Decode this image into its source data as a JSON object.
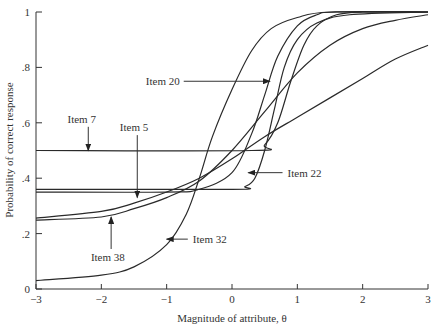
{
  "chart_data": {
    "type": "line",
    "title": "",
    "xlabel": "Magnitude of attribute, θ",
    "ylabel": "Probability of correct response",
    "xlim": [
      -3,
      3
    ],
    "ylim": [
      0,
      1
    ],
    "xticks": [
      -3,
      -2,
      -1,
      0,
      1,
      2,
      3
    ],
    "xtick_labels": [
      "−3",
      "−2",
      "−1",
      "0",
      "1",
      "2",
      "3"
    ],
    "yticks": [
      0,
      0.2,
      0.4,
      0.6,
      0.8,
      1
    ],
    "ytick_labels": [
      "0",
      ".2",
      ".4",
      ".6",
      ".8",
      "1"
    ],
    "grid": false,
    "legend": "none (inline annotations with arrows)",
    "series": [
      {
        "name": "Item 32",
        "x": [
          -3,
          -2,
          -1.5,
          -1,
          -0.7,
          -0.5,
          -0.3,
          0,
          0.3,
          0.6,
          1,
          1.5,
          3
        ],
        "values": [
          0.03,
          0.05,
          0.08,
          0.16,
          0.27,
          0.4,
          0.55,
          0.72,
          0.86,
          0.94,
          0.98,
          1,
          1
        ]
      },
      {
        "name": "Item 20",
        "x": [
          -3,
          -1,
          -0.5,
          0,
          0.3,
          0.5,
          0.7,
          1,
          1.3,
          1.6,
          3
        ],
        "values": [
          0.35,
          0.35,
          0.36,
          0.42,
          0.56,
          0.7,
          0.84,
          0.95,
          0.99,
          1,
          1
        ]
      },
      {
        "name": "Item 7",
        "x": [
          -3,
          0.3,
          0.5,
          0.7,
          0.9,
          1.1,
          1.3,
          1.6,
          2,
          3
        ],
        "values": [
          0.5,
          0.5,
          0.52,
          0.6,
          0.75,
          0.88,
          0.95,
          0.99,
          1,
          1
        ]
      },
      {
        "name": "Item 22",
        "x": [
          -3,
          0,
          0.2,
          0.35,
          0.5,
          0.65,
          0.8,
          1,
          1.3,
          1.8,
          3
        ],
        "values": [
          0.36,
          0.36,
          0.37,
          0.4,
          0.5,
          0.65,
          0.8,
          0.9,
          0.96,
          0.99,
          1
        ]
      },
      {
        "name": "Item 5",
        "x": [
          -3,
          -2,
          -1.5,
          -1,
          -0.5,
          0,
          0.5,
          1,
          1.5,
          2,
          2.5,
          3
        ],
        "values": [
          0.256,
          0.28,
          0.31,
          0.35,
          0.4,
          0.47,
          0.55,
          0.62,
          0.69,
          0.76,
          0.83,
          0.88
        ]
      },
      {
        "name": "Item 38",
        "x": [
          -3,
          -2,
          -1.5,
          -1,
          -0.5,
          0,
          0.5,
          1,
          1.5,
          2,
          2.5,
          3
        ],
        "values": [
          0.249,
          0.26,
          0.29,
          0.33,
          0.39,
          0.5,
          0.64,
          0.78,
          0.88,
          0.94,
          0.97,
          0.99
        ]
      }
    ],
    "annotations": [
      {
        "text": "Item 7",
        "label_x": -2.3,
        "label_y": 0.6,
        "arrow_to": [
          -2.2,
          0.5
        ],
        "direction": "down"
      },
      {
        "text": "Item 5",
        "label_x": -1.5,
        "label_y": 0.57,
        "arrow_to": [
          -1.45,
          0.33
        ],
        "direction": "down"
      },
      {
        "text": "Item 20",
        "label_x": -0.8,
        "label_y": 0.75,
        "arrow_to": [
          0.58,
          0.75
        ],
        "direction": "right"
      },
      {
        "text": "Item 22",
        "label_x": 0.85,
        "label_y": 0.42,
        "arrow_to": [
          0.25,
          0.42
        ],
        "direction": "left"
      },
      {
        "text": "Item 38",
        "label_x": -1.9,
        "label_y": 0.13,
        "arrow_to": [
          -1.85,
          0.26
        ],
        "direction": "up"
      },
      {
        "text": "Item 32",
        "label_x": -0.6,
        "label_y": 0.18,
        "arrow_to": [
          -1.0,
          0.18
        ],
        "direction": "left"
      }
    ]
  },
  "labels": {
    "xlabel": "Magnitude of attribute, θ",
    "ylabel": "Probability of correct response"
  }
}
